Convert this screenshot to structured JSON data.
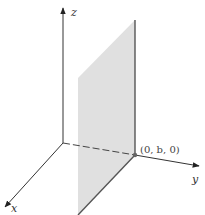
{
  "diagram": {
    "axes": {
      "x": {
        "label": "x"
      },
      "y": {
        "label": "y"
      },
      "z": {
        "label": "z"
      }
    },
    "point": {
      "label": "(0, b, 0)",
      "coords": [
        0,
        "b",
        0
      ]
    },
    "plane": {
      "description": "vertical plane parallel to xz-plane passing through (0, b, 0)",
      "fill": "#e0e0e0",
      "edge": "#555555"
    },
    "colors": {
      "axis": "#333333",
      "dashed": "#444444",
      "background": "#ffffff"
    }
  }
}
